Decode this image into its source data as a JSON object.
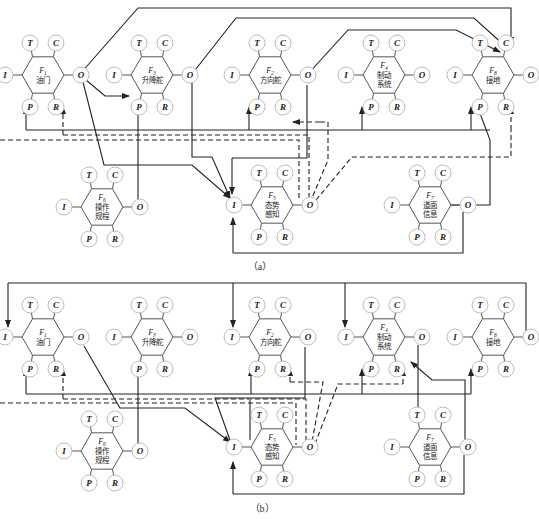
{
  "aspects": {
    "T": "T",
    "C": "C",
    "I": "I",
    "O": "O",
    "P": "P",
    "R": "R"
  },
  "panels": [
    {
      "caption": "（a）",
      "functions": [
        {
          "id": "F1",
          "sub": "1",
          "name_lines": [
            "油门"
          ],
          "cx": 43,
          "cy": 75
        },
        {
          "id": "F3",
          "sub": "3",
          "name_lines": [
            "升降舵"
          ],
          "cx": 152,
          "cy": 75
        },
        {
          "id": "F2",
          "sub": "2",
          "name_lines": [
            "方向舵"
          ],
          "cx": 270,
          "cy": 75
        },
        {
          "id": "F4",
          "sub": "4",
          "name_lines": [
            "制动",
            "系统"
          ],
          "cx": 384,
          "cy": 75
        },
        {
          "id": "F8",
          "sub": "8",
          "name_lines": [
            "接地"
          ],
          "cx": 493,
          "cy": 75
        },
        {
          "id": "F6",
          "sub": "6",
          "name_lines": [
            "操作",
            "规程"
          ],
          "cx": 102,
          "cy": 207
        },
        {
          "id": "F5",
          "sub": "5",
          "name_lines": [
            "态势",
            "感知"
          ],
          "cx": 272,
          "cy": 205
        },
        {
          "id": "F7",
          "sub": "7",
          "name_lines": [
            "道面",
            "信息"
          ],
          "cx": 430,
          "cy": 205
        }
      ]
    },
    {
      "caption": "（b）",
      "functions": [
        {
          "id": "F1",
          "sub": "1",
          "name_lines": [
            "油门"
          ],
          "cx": 43,
          "cy": 337
        },
        {
          "id": "F3",
          "sub": "3",
          "name_lines": [
            "升降舵"
          ],
          "cx": 152,
          "cy": 337
        },
        {
          "id": "F2",
          "sub": "2",
          "name_lines": [
            "方向舵"
          ],
          "cx": 270,
          "cy": 337
        },
        {
          "id": "F4",
          "sub": "4",
          "name_lines": [
            "制动",
            "系统"
          ],
          "cx": 384,
          "cy": 337
        },
        {
          "id": "F8",
          "sub": "8",
          "name_lines": [
            "接地"
          ],
          "cx": 493,
          "cy": 337
        },
        {
          "id": "F6",
          "sub": "6",
          "name_lines": [
            "操作",
            "规程"
          ],
          "cx": 102,
          "cy": 451
        },
        {
          "id": "F5",
          "sub": "5",
          "name_lines": [
            "态势",
            "感知"
          ],
          "cx": 272,
          "cy": 447
        },
        {
          "id": "F7",
          "sub": "7",
          "name_lines": [
            "道面",
            "信息"
          ],
          "cx": 430,
          "cy": 447
        }
      ]
    }
  ],
  "panel_a": {
    "caption": "（a）"
  },
  "panel_b": {
    "caption": "（b）"
  }
}
